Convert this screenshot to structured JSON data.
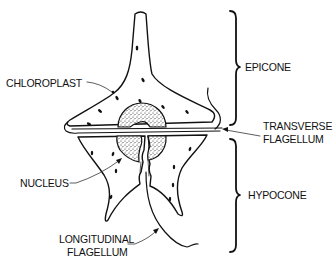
{
  "diagram": {
    "labels": {
      "chloroplast": "CHLOROPLAST",
      "nucleus": "NUCLEUS",
      "longitudinal_line1": "LONGITUDINAL",
      "longitudinal_line2": "FLAGELLUM",
      "transverse_line1": "TRANSVERSE",
      "transverse_line2": "FLAGELLUM",
      "epicone": "EPICONE",
      "hypocone": "HYPOCONE"
    },
    "regions": [
      {
        "name": "epicone",
        "bracket": "upper"
      },
      {
        "name": "hypocone",
        "bracket": "lower"
      }
    ],
    "colors": {
      "ink": "#111111",
      "background": "#ffffff"
    }
  }
}
